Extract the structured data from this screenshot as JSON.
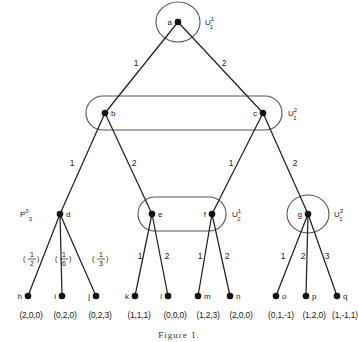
{
  "figure": {
    "caption": "Figure 1.",
    "nodes": {
      "a": {
        "label": "a",
        "x": 178,
        "y": 22
      },
      "b": {
        "label": "b",
        "x": 105,
        "y": 113
      },
      "c": {
        "label": "c",
        "x": 263,
        "y": 113
      },
      "d": {
        "label": "d",
        "x": 60,
        "y": 214
      },
      "e": {
        "label": "e",
        "x": 152,
        "y": 214
      },
      "f": {
        "label": "f",
        "x": 212,
        "y": 214
      },
      "g": {
        "label": "g",
        "x": 308,
        "y": 214
      },
      "h": {
        "label": "h",
        "x": 28,
        "y": 296
      },
      "i": {
        "label": "i",
        "x": 62,
        "y": 296
      },
      "j": {
        "label": "j",
        "x": 96,
        "y": 296
      },
      "k": {
        "label": "k",
        "x": 135,
        "y": 296
      },
      "l": {
        "label": "l",
        "x": 168,
        "y": 296
      },
      "m": {
        "label": "m",
        "x": 198,
        "y": 296
      },
      "n": {
        "label": "n",
        "x": 230,
        "y": 296
      },
      "o": {
        "label": "o",
        "x": 276,
        "y": 296
      },
      "p": {
        "label": "p",
        "x": 306,
        "y": 296
      },
      "q": {
        "label": "q",
        "x": 337,
        "y": 296
      }
    },
    "edges": [
      {
        "from": "a",
        "to": "b",
        "label": "1",
        "lx": 136,
        "ly": 66
      },
      {
        "from": "a",
        "to": "c",
        "label": "2",
        "lx": 224,
        "ly": 66
      },
      {
        "from": "b",
        "to": "d",
        "label": "1",
        "lx": 72,
        "ly": 166
      },
      {
        "from": "b",
        "to": "e",
        "label": "2",
        "lx": 134,
        "ly": 166
      },
      {
        "from": "c",
        "to": "f",
        "label": "1",
        "lx": 231,
        "ly": 166
      },
      {
        "from": "c",
        "to": "g",
        "label": "2",
        "lx": 295,
        "ly": 166
      },
      {
        "from": "d",
        "to": "h",
        "label": "",
        "lx": 0,
        "ly": 0
      },
      {
        "from": "d",
        "to": "i",
        "label": "",
        "lx": 0,
        "ly": 0
      },
      {
        "from": "d",
        "to": "j",
        "label": "",
        "lx": 0,
        "ly": 0
      },
      {
        "from": "e",
        "to": "k",
        "label": "1",
        "lx": 140,
        "ly": 259
      },
      {
        "from": "e",
        "to": "l",
        "label": "2",
        "lx": 167,
        "ly": 259
      },
      {
        "from": "f",
        "to": "m",
        "label": "1",
        "lx": 200,
        "ly": 259
      },
      {
        "from": "f",
        "to": "n",
        "label": "2",
        "lx": 227,
        "ly": 259
      },
      {
        "from": "g",
        "to": "o",
        "label": "1",
        "lx": 283,
        "ly": 259
      },
      {
        "from": "g",
        "to": "p",
        "label": "2",
        "lx": 303,
        "ly": 259
      },
      {
        "from": "g",
        "to": "q",
        "label": "3",
        "lx": 327,
        "ly": 259
      }
    ],
    "chance_probabilities": [
      {
        "numerator": "1",
        "denominator": "2",
        "x": 32,
        "y": 258,
        "text": "(1/2)"
      },
      {
        "numerator": "1",
        "denominator": "6",
        "x": 64,
        "y": 258,
        "text": "(1/6)"
      },
      {
        "numerator": "1",
        "denominator": "3",
        "x": 101,
        "y": 258,
        "text": "(1/3)"
      }
    ],
    "information_sets": [
      {
        "name": "U-1-1",
        "shape": "circle",
        "label_base": "U",
        "label_sup": "1",
        "label_sub": "1",
        "cx": 178,
        "cy": 22,
        "rx": 22,
        "ry": 20,
        "label_x": 205,
        "label_y": 22
      },
      {
        "name": "U-1-2",
        "shape": "stadium",
        "label_base": "U",
        "label_sup": "2",
        "label_sub": "1",
        "cx": 184,
        "cy": 113,
        "rx": 98,
        "ry": 17,
        "label_x": 288,
        "label_y": 113
      },
      {
        "name": "U-2-1",
        "shape": "stadium",
        "label_base": "U",
        "label_sup": "1",
        "label_sub": "2",
        "cx": 182,
        "cy": 214,
        "rx": 44,
        "ry": 17,
        "label_x": 232,
        "label_y": 214
      },
      {
        "name": "U-1-3",
        "shape": "circle",
        "label_base": "U",
        "label_sup": "3",
        "label_sub": "1",
        "cx": 308,
        "cy": 214,
        "rx": 21,
        "ry": 19,
        "label_x": 334,
        "label_y": 214
      }
    ],
    "player_label": {
      "base": "P",
      "sup": "0",
      "sub": "3",
      "x": 32,
      "y": 214,
      "text": "P03"
    },
    "payoffs": [
      {
        "node": "h",
        "text": "(2,0,0)",
        "x": 31,
        "y": 318
      },
      {
        "node": "i",
        "text": "(0,2,0)",
        "x": 65,
        "y": 318
      },
      {
        "node": "j",
        "text": "(0,2,3)",
        "x": 100,
        "y": 318
      },
      {
        "node": "k",
        "text": "(1,1,1)",
        "x": 139,
        "y": 318
      },
      {
        "node": "l",
        "text": "(0,0,0)",
        "x": 175,
        "y": 318
      },
      {
        "node": "m",
        "text": "(1,2,3)",
        "x": 208,
        "y": 318
      },
      {
        "node": "n",
        "text": "(2,0,0)",
        "x": 241,
        "y": 318
      },
      {
        "node": "o",
        "text": "(0,1,-1)",
        "x": 281,
        "y": 318
      },
      {
        "node": "p",
        "text": "(1,2,0)",
        "x": 314,
        "y": 318
      },
      {
        "node": "q",
        "text": "(1,-1,1)",
        "x": 345,
        "y": 318
      }
    ]
  }
}
